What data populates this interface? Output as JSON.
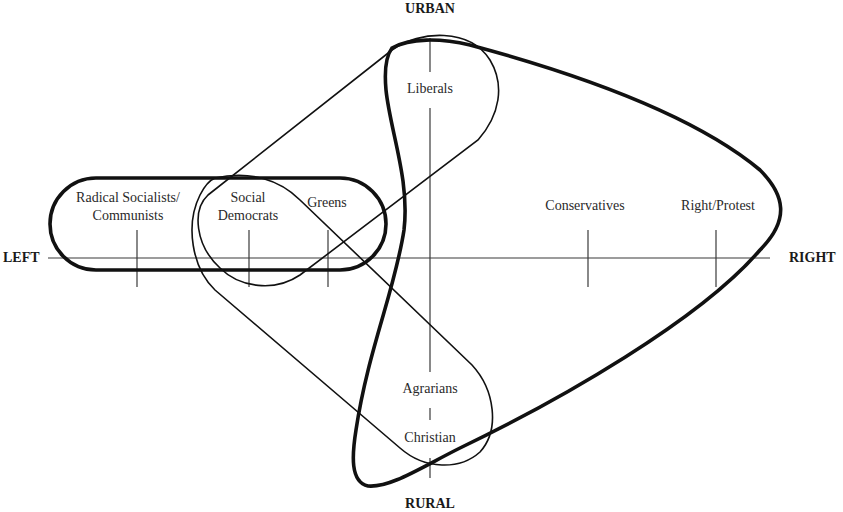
{
  "diagram": {
    "axes": {
      "top": "URBAN",
      "bottom": "RURAL",
      "left": "LEFT",
      "right": "RIGHT"
    },
    "parties": {
      "radical_line1": "Radical Socialists/",
      "radical_line2": "Communists",
      "social_line1": "Social",
      "social_line2": "Democrats",
      "greens": "Greens",
      "liberals": "Liberals",
      "conservatives": "Conservatives",
      "right_protest": "Right/Protest",
      "agrarians": "Agrarians",
      "christian": "Christian"
    },
    "groupings": [
      {
        "name": "left-bloc",
        "members": [
          "Radical Socialists/Communists",
          "Social Democrats",
          "Greens"
        ],
        "stroke": "thick"
      },
      {
        "name": "urban-diagonal",
        "members": [
          "Social Democrats",
          "Greens",
          "Liberals"
        ],
        "stroke": "thin"
      },
      {
        "name": "rural-diagonal",
        "members": [
          "Social Democrats",
          "Greens",
          "Agrarians",
          "Christian"
        ],
        "stroke": "thin"
      },
      {
        "name": "right-bloc",
        "members": [
          "Liberals",
          "Agrarians",
          "Christian",
          "Conservatives",
          "Right/Protest"
        ],
        "stroke": "thick"
      }
    ],
    "colors": {
      "line": "#111111",
      "text": "#2a2a2a",
      "background": "#ffffff"
    }
  }
}
